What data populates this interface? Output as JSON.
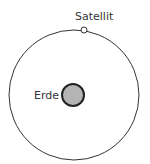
{
  "diagram": {
    "labels": {
      "satellite": "Satellit",
      "earth": "Erde"
    },
    "colors": {
      "line": "#222222",
      "earth_fill": "#b4b4b4",
      "satellite_fill": "#ffffff",
      "text": "#333333"
    }
  }
}
